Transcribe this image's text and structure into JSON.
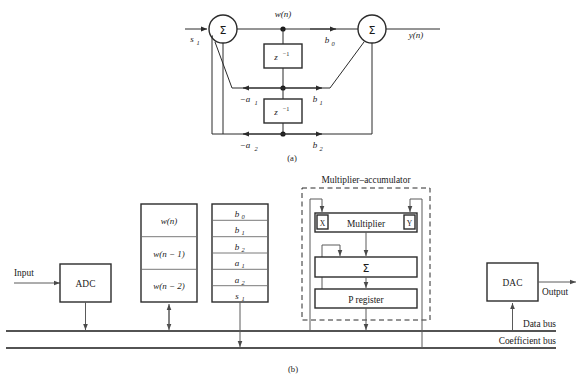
{
  "figure": {
    "captions": {
      "a": "(a)",
      "b": "(b)"
    }
  },
  "diagram_a": {
    "name": "signal-flow-graph",
    "input_label": "s",
    "input_sub": "1",
    "output_label": "y(n)",
    "node_label": "w(n)",
    "summers": [
      {
        "name": "input-summer",
        "glyph": "Σ"
      },
      {
        "name": "output-summer",
        "glyph": "Σ"
      }
    ],
    "delays": [
      {
        "name": "delay-1",
        "base": "z",
        "exp": "−1"
      },
      {
        "name": "delay-2",
        "base": "z",
        "exp": "−1"
      }
    ],
    "coefficients": {
      "b0": {
        "base": "b",
        "sub": "0"
      },
      "b1": {
        "base": "b",
        "sub": "1"
      },
      "b2": {
        "base": "b",
        "sub": "2"
      },
      "a1": {
        "base": "−a",
        "sub": "1"
      },
      "a2": {
        "base": "−a",
        "sub": "2"
      }
    }
  },
  "diagram_b": {
    "name": "hardware-block-diagram",
    "input_label": "Input",
    "output_label": "Output",
    "adc": {
      "label": "ADC"
    },
    "dac": {
      "label": "DAC"
    },
    "data_register": {
      "name": "data-register-stack",
      "cells": [
        "w(n)",
        "w(n − 1)",
        "w(n − 2)"
      ]
    },
    "coefficient_register": {
      "name": "coefficient-register-stack",
      "cells": [
        {
          "base": "b",
          "sub": "0"
        },
        {
          "base": "b",
          "sub": "1"
        },
        {
          "base": "b",
          "sub": "2"
        },
        {
          "base": "a",
          "sub": "1"
        },
        {
          "base": "a",
          "sub": "2"
        },
        {
          "base": "s",
          "sub": "1"
        }
      ]
    },
    "mac": {
      "title": "Multiplier–accumulator",
      "multiplier": {
        "label": "Multiplier",
        "port_x": "X",
        "port_y": "Y"
      },
      "adder": {
        "label": "Σ"
      },
      "p_register": {
        "label": "P register"
      }
    },
    "buses": [
      {
        "name": "data-bus",
        "label": "Data bus"
      },
      {
        "name": "coefficient-bus",
        "label": "Coefficient bus"
      }
    ]
  },
  "colors": {
    "ink": "#1a1a1a",
    "line": "#2b2b2b",
    "thin_line": "#5a5a5a",
    "paper": "#ffffff"
  }
}
